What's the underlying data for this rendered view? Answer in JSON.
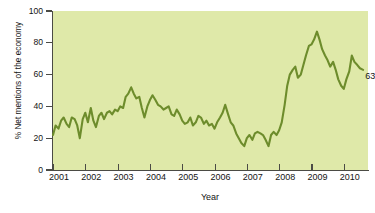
{
  "chart_data": {
    "type": "line",
    "title": "",
    "xlabel": "Year",
    "ylabel": "% Net mentions of the economy",
    "xlim": [
      2001.0,
      2010.75
    ],
    "ylim": [
      0,
      100
    ],
    "grid": false,
    "legend": "none",
    "line_color": "#6d8c2c",
    "plot_background": "#dfe9a9",
    "y_ticks": [
      0,
      20,
      40,
      60,
      80,
      100
    ],
    "y_tick_labels": [
      "0",
      "20",
      "40",
      "60",
      "80",
      "100"
    ],
    "x_ticks": [
      2001,
      2002,
      2003,
      2004,
      2005,
      2006,
      2007,
      2008,
      2009,
      2010
    ],
    "x_tick_labels": [
      "2001",
      "2002",
      "2003",
      "2004",
      "2005",
      "2006",
      "2007",
      "2008",
      "2009",
      "2010"
    ],
    "annotations": [
      {
        "text": "63",
        "x": 2010.6,
        "y": 63,
        "name": "endpoint-value-label"
      }
    ],
    "series": [
      {
        "name": "Net mentions of the economy",
        "color": "#6d8c2c",
        "x": [
          2001.0,
          2001.08,
          2001.17,
          2001.25,
          2001.33,
          2001.42,
          2001.5,
          2001.58,
          2001.67,
          2001.75,
          2001.83,
          2001.92,
          2002.0,
          2002.08,
          2002.17,
          2002.25,
          2002.33,
          2002.42,
          2002.5,
          2002.58,
          2002.67,
          2002.75,
          2002.83,
          2002.92,
          2003.0,
          2003.08,
          2003.17,
          2003.25,
          2003.33,
          2003.42,
          2003.5,
          2003.58,
          2003.67,
          2003.75,
          2003.83,
          2003.92,
          2004.0,
          2004.08,
          2004.17,
          2004.25,
          2004.33,
          2004.42,
          2004.5,
          2004.58,
          2004.67,
          2004.75,
          2004.83,
          2004.92,
          2005.0,
          2005.08,
          2005.17,
          2005.25,
          2005.33,
          2005.42,
          2005.5,
          2005.58,
          2005.67,
          2005.75,
          2005.83,
          2005.92,
          2006.0,
          2006.08,
          2006.17,
          2006.25,
          2006.33,
          2006.42,
          2006.5,
          2006.58,
          2006.67,
          2006.75,
          2006.83,
          2006.92,
          2007.0,
          2007.08,
          2007.17,
          2007.25,
          2007.33,
          2007.42,
          2007.5,
          2007.58,
          2007.67,
          2007.75,
          2007.83,
          2007.92,
          2008.0,
          2008.08,
          2008.17,
          2008.25,
          2008.33,
          2008.42,
          2008.5,
          2008.58,
          2008.67,
          2008.75,
          2008.83,
          2008.92,
          2009.0,
          2009.08,
          2009.17,
          2009.25,
          2009.33,
          2009.42,
          2009.5,
          2009.58,
          2009.67,
          2009.75,
          2009.83,
          2009.92,
          2010.0,
          2010.08,
          2010.17,
          2010.25,
          2010.33,
          2010.42,
          2010.5,
          2010.6
        ],
        "values": [
          22,
          28,
          26,
          31,
          33,
          29,
          27,
          33,
          32,
          28,
          20,
          32,
          36,
          30,
          39,
          31,
          27,
          34,
          36,
          32,
          36,
          37,
          35,
          38,
          37,
          40,
          39,
          46,
          48,
          52,
          48,
          45,
          46,
          39,
          33,
          40,
          44,
          47,
          44,
          41,
          40,
          38,
          39,
          40,
          35,
          34,
          38,
          35,
          31,
          29,
          30,
          33,
          28,
          30,
          34,
          33,
          29,
          31,
          28,
          29,
          26,
          30,
          33,
          36,
          41,
          35,
          30,
          28,
          23,
          20,
          17,
          15,
          20,
          22,
          19,
          23,
          24,
          23,
          22,
          19,
          15,
          22,
          24,
          22,
          25,
          30,
          41,
          53,
          60,
          63,
          65,
          58,
          60,
          66,
          72,
          78,
          79,
          82,
          87,
          82,
          76,
          72,
          69,
          65,
          68,
          63,
          57,
          53,
          51,
          57,
          62,
          72,
          68,
          66,
          64,
          63
        ]
      }
    ]
  },
  "axis": {
    "y_title": "% Net mentions of the economy",
    "x_title": "Year"
  }
}
